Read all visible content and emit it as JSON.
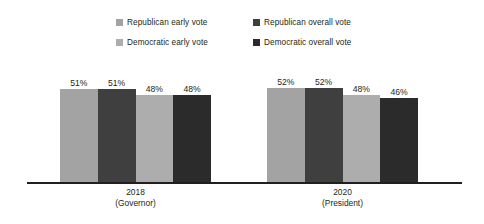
{
  "chart_data": {
    "type": "bar",
    "title": "",
    "subtitle": "",
    "xlabel": "",
    "ylabel": "",
    "grid": false,
    "legend_position": "top",
    "ylim": [
      0,
      60
    ],
    "categories": [
      "2018\n(Governor)",
      "2020\n(President)"
    ],
    "category_lines": [
      {
        "line1": "2018",
        "line2": "(Governor)"
      },
      {
        "line1": "2020",
        "line2": "(President)"
      }
    ],
    "series": [
      {
        "name": "Republican early vote",
        "color": "#a3a3a3",
        "values": [
          51,
          52
        ],
        "labels": [
          "51%",
          "52%"
        ]
      },
      {
        "name": "Republican overall vote",
        "color": "#3f3f3f",
        "values": [
          51,
          52
        ],
        "labels": [
          "51%",
          "52%"
        ]
      },
      {
        "name": "Democratic early vote",
        "color": "#adadad",
        "values": [
          48,
          48
        ],
        "labels": [
          "48%",
          "48%"
        ]
      },
      {
        "name": "Democratic overall vote",
        "color": "#2b2b2b",
        "values": [
          48,
          46
        ],
        "labels": [
          "48%",
          "46%"
        ]
      }
    ],
    "value_suffix": "%"
  },
  "legend": {
    "items": [
      {
        "label": "Republican early vote",
        "color": "#a3a3a3"
      },
      {
        "label": "Republican overall vote",
        "color": "#3f3f3f"
      },
      {
        "label": "Democratic early vote",
        "color": "#adadad"
      },
      {
        "label": "Democratic overall vote",
        "color": "#2b2b2b"
      }
    ]
  },
  "axis": {
    "baseline_color": "#231f20"
  }
}
